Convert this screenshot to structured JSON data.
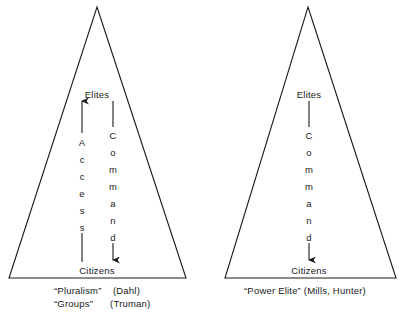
{
  "figure": {
    "background_color": "#ffffff",
    "line_color": "#1a1a1a",
    "text_color": "#1a1a1a"
  },
  "diagrams": [
    {
      "id": "pluralism-model",
      "apex": {
        "x": 97,
        "y": 7
      },
      "base_left": {
        "x": 9,
        "y": 278
      },
      "base_right": {
        "x": 186,
        "y": 278
      },
      "top_node": "Elites",
      "bottom_node": "Citizens",
      "top_node_y": 95,
      "bottom_node_y": 271,
      "flows": [
        {
          "id": "access-flow",
          "label": "Access",
          "letters": [
            "A",
            "c",
            "c",
            "e",
            "s",
            "s"
          ],
          "direction": "up",
          "x": 82,
          "arrow_tip_y": 101,
          "arrow_tail_y": 262,
          "letters_start_y": 138,
          "letter_spacing": 17
        },
        {
          "id": "command-flow",
          "label": "Command",
          "letters": [
            "C",
            "o",
            "m",
            "m",
            "a",
            "n",
            "d"
          ],
          "direction": "down",
          "x": 113,
          "arrow_tip_y": 260,
          "arrow_tail_y": 101,
          "letters_start_y": 131,
          "letter_spacing": 17
        }
      ],
      "caption_lines": [
        "“Pluralism”    (Dahl)",
        "“Groups”      (Truman)"
      ],
      "caption_x": 54,
      "caption_y": 285,
      "caption_line_height": 13
    },
    {
      "id": "power-elite-model",
      "apex": {
        "x": 308,
        "y": 7
      },
      "base_left": {
        "x": 225,
        "y": 278
      },
      "base_right": {
        "x": 396,
        "y": 278
      },
      "top_node": "Elites",
      "bottom_node": "Citizens",
      "top_node_y": 95,
      "bottom_node_y": 271,
      "flows": [
        {
          "id": "command-flow",
          "label": "Command",
          "letters": [
            "C",
            "o",
            "m",
            "m",
            "a",
            "n",
            "d"
          ],
          "direction": "down",
          "x": 309,
          "arrow_tip_y": 260,
          "arrow_tail_y": 101,
          "letters_start_y": 131,
          "letter_spacing": 17
        }
      ],
      "caption_lines": [
        "“Power Elite” (Mills, Hunter)"
      ],
      "caption_x": 244,
      "caption_y": 285,
      "caption_line_height": 13
    }
  ]
}
